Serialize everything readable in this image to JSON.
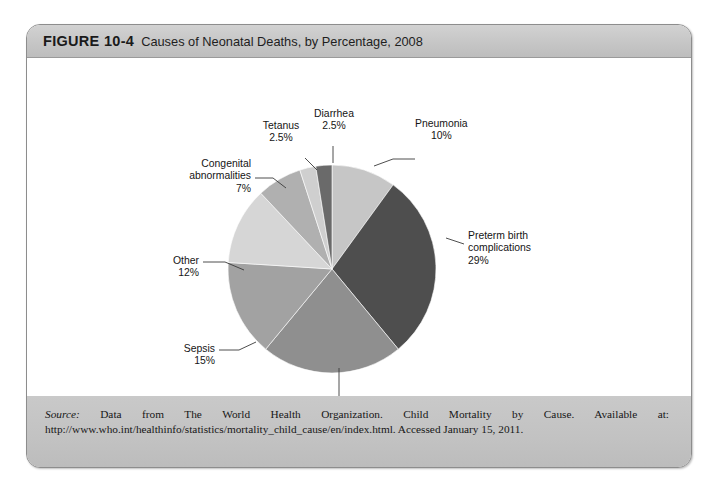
{
  "figure": {
    "number": "FIGURE 10-4",
    "caption": "Causes of Neonatal Deaths, by Percentage, 2008",
    "source_prefix": "Source:",
    "source_body": " Data from The World Health Organization. Child Mortality by Cause. Available at: http://www.who.int/healthinfo/statistics/mortality_child_cause/en/index.html. Accessed January 15, 2011."
  },
  "chart_data": {
    "type": "pie",
    "title": "Causes of Neonatal Deaths, by Percentage, 2008",
    "xlabel": "",
    "ylabel": "",
    "legend": "none (direct slice labels with leader lines)",
    "units": "percent",
    "start_angle_deg": 0,
    "direction": "clockwise",
    "categories": [
      "Pneumonia",
      "Preterm birth complications",
      "Birth asphyxia",
      "Sepsis",
      "Other",
      "Congenital abnormalities",
      "Tetanus",
      "Diarrhea"
    ],
    "values": [
      10,
      29,
      22,
      15,
      12,
      7,
      2.5,
      2.5
    ],
    "labels": [
      "Pneumonia\n10%",
      "Preterm birth\ncomplications\n29%",
      "Birth asphyxia\n22%",
      "Sepsis\n15%",
      "Other\n12%",
      "Congenital\nabnormalities\n7%",
      "Tetanus\n2.5%",
      "Diarrhea\n2.5%"
    ],
    "colors": [
      "#c6c6c6",
      "#4e4e4e",
      "#8f8f8f",
      "#a2a2a2",
      "#d6d6d6",
      "#b0b0b0",
      "#cfcfcf",
      "#6a6a6a"
    ],
    "slices": [
      {
        "name": "Pneumonia",
        "value": 10,
        "display": "10%",
        "color": "#c6c6c6"
      },
      {
        "name": "Preterm birth complications",
        "value": 29,
        "display": "29%",
        "color": "#4e4e4e"
      },
      {
        "name": "Birth asphyxia",
        "value": 22,
        "display": "22%",
        "color": "#8f8f8f"
      },
      {
        "name": "Sepsis",
        "value": 15,
        "display": "15%",
        "color": "#a2a2a2"
      },
      {
        "name": "Other",
        "value": 12,
        "display": "12%",
        "color": "#d6d6d6"
      },
      {
        "name": "Congenital abnormalities",
        "value": 7,
        "display": "7%",
        "color": "#b0b0b0"
      },
      {
        "name": "Tetanus",
        "value": 2.5,
        "display": "2.5%",
        "color": "#cfcfcf"
      },
      {
        "name": "Diarrhea",
        "value": 2.5,
        "display": "2.5%",
        "color": "#6a6a6a"
      }
    ]
  },
  "labels": {
    "pneumonia_l1": "Pneumonia",
    "pneumonia_l2": "10%",
    "preterm_l1": "Preterm birth",
    "preterm_l2": "complications",
    "preterm_l3": "29%",
    "asphyxia_l1": "Birth asphyxia",
    "asphyxia_l2": "22%",
    "sepsis_l1": "Sepsis",
    "sepsis_l2": "15%",
    "other_l1": "Other",
    "other_l2": "12%",
    "congenital_l1": "Congenital",
    "congenital_l2": "abnormalities",
    "congenital_l3": "7%",
    "tetanus_l1": "Tetanus",
    "tetanus_l2": "2.5%",
    "diarrhea_l1": "Diarrhea",
    "diarrhea_l2": "2.5%"
  }
}
